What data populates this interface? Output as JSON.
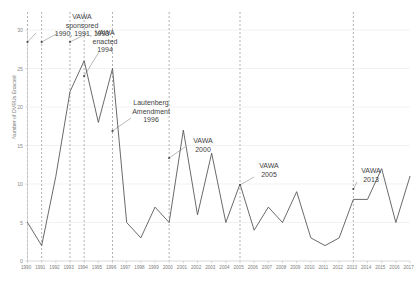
{
  "chart_data": {
    "type": "line",
    "title": "",
    "xlabel": "",
    "ylabel": "Number of DVRUs Enacted",
    "ylim": [
      0,
      30
    ],
    "ytick_values": [
      0,
      5,
      10,
      15,
      20,
      25,
      30
    ],
    "ytick_labels": [
      "0",
      "5",
      "10",
      "15",
      "20",
      "25",
      "30"
    ],
    "grid": true,
    "legend": "none",
    "categories": [
      "1990",
      "1991",
      "1992",
      "1993",
      "1994",
      "1995",
      "1996",
      "1997",
      "1998",
      "1999",
      "2000",
      "2001",
      "2002",
      "2003",
      "2004",
      "2005",
      "2006",
      "2007",
      "2008",
      "2009",
      "2010",
      "2011",
      "2012",
      "2013",
      "2014",
      "2015",
      "2016",
      "2017"
    ],
    "values": [
      5,
      2,
      11,
      22,
      26,
      18,
      25,
      5,
      3,
      7,
      5,
      17,
      6,
      14,
      5,
      10,
      4,
      7,
      5,
      9,
      3,
      2,
      3,
      8,
      8,
      12,
      5,
      11
    ],
    "series": [
      {
        "name": "DVRUs Enacted",
        "color": "#595959",
        "values": [
          5,
          2,
          11,
          22,
          26,
          18,
          25,
          5,
          3,
          7,
          5,
          17,
          6,
          14,
          5,
          10,
          4,
          7,
          5,
          9,
          3,
          2,
          3,
          8,
          8,
          12,
          5,
          11
        ]
      }
    ],
    "event_lines": [
      {
        "year": "1990",
        "label": "VAWA sponsored 1990, 1991, 1993"
      },
      {
        "year": "1991",
        "label": "VAWA sponsored 1990, 1991, 1993"
      },
      {
        "year": "1993",
        "label": "VAWA sponsored 1990, 1991, 1993"
      },
      {
        "year": "1994",
        "label": "VAWA enacted 1994"
      },
      {
        "year": "1996",
        "label": "Lautenberg Amendment 1996"
      },
      {
        "year": "2000",
        "label": "VAWA 2000"
      },
      {
        "year": "2005",
        "label": "VAWA 2005"
      },
      {
        "year": "2013",
        "label": "VAWA 2013"
      }
    ],
    "annotations": [
      {
        "id": "vawa-sponsored",
        "line1": "VAWA",
        "line2": "sponsored",
        "line3": "1990, 1991, 1993"
      },
      {
        "id": "vawa-enacted",
        "line1": "VAWA",
        "line2": "enacted",
        "line3": "1994"
      },
      {
        "id": "lautenberg",
        "line1": "Lautenberg",
        "line2": "Amendment",
        "line3": "1996"
      },
      {
        "id": "vawa-2000",
        "line1": "VAWA",
        "line2": "2000",
        "line3": ""
      },
      {
        "id": "vawa-2005",
        "line1": "VAWA",
        "line2": "2005",
        "line3": ""
      },
      {
        "id": "vawa-2013",
        "line1": "VAWA",
        "line2": "2013",
        "line3": ""
      }
    ]
  },
  "axis": {
    "y_title": "Number of DVRUs Enacted"
  }
}
